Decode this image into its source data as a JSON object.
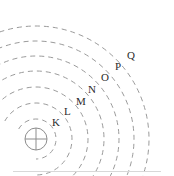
{
  "figure": {
    "width": 174,
    "height": 176,
    "background_color": "#ffffff",
    "line_color": "#9a9a9a",
    "label_color": "#2b2b2b",
    "baseline_color": "#d8d8d8"
  },
  "nucleus": {
    "name": "nucleus",
    "center_x": 36,
    "center_y": 139,
    "radius": 11,
    "glyph": "circle-with-crosshair",
    "stroke_color": "#8d8d8d"
  },
  "shells": [
    {
      "label": "K",
      "index": 1,
      "radius": 20,
      "label_x": 52,
      "label_y": 117
    },
    {
      "label": "L",
      "index": 2,
      "radius": 36,
      "label_x": 64,
      "label_y": 106
    },
    {
      "label": "M",
      "index": 3,
      "radius": 52,
      "label_x": 76,
      "label_y": 96
    },
    {
      "label": "N",
      "index": 4,
      "radius": 68,
      "label_x": 88,
      "label_y": 84
    },
    {
      "label": "O",
      "index": 5,
      "radius": 83,
      "label_x": 101,
      "label_y": 72
    },
    {
      "label": "P",
      "index": 6,
      "radius": 98,
      "label_x": 115,
      "label_y": 61
    },
    {
      "label": "Q",
      "index": 7,
      "radius": 113,
      "label_x": 127,
      "label_y": 50
    }
  ],
  "arc_style": {
    "dash_pattern": "5 4",
    "stroke_width": 1,
    "start_angle_deg": -150,
    "end_angle_deg": 90
  }
}
